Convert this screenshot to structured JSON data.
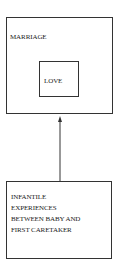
{
  "diagram": {
    "outer_box": {
      "label": "MARRIAGE"
    },
    "inner_box": {
      "label": "LOVE"
    },
    "bottom_box": {
      "lines": [
        "INFANTILE",
        "EXPERIENCES",
        "BETWEEN BABY AND",
        "FIRST CARETAKER"
      ]
    },
    "edges": [
      {
        "from": "bottom_box",
        "to": "outer_box",
        "style": "arrow"
      }
    ],
    "colors": {
      "stroke": "#333333",
      "background": "#ffffff"
    }
  }
}
